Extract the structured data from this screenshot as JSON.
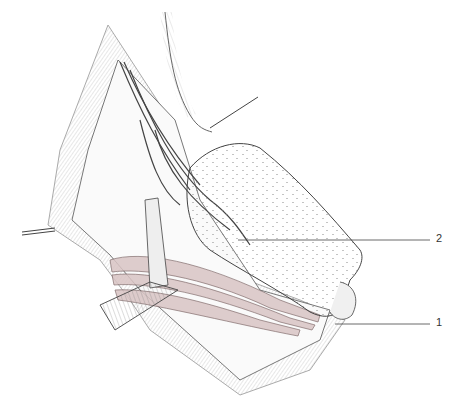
{
  "figure": {
    "type": "anatomical-illustration",
    "style": "pen-and-ink line drawing, grayscale with faint pink muscle tint",
    "labels": [
      {
        "id": "2",
        "text": "2",
        "leader_from": [
          238,
          240
        ],
        "leader_to": [
          430,
          240
        ]
      },
      {
        "id": "1",
        "text": "1",
        "leader_from": [
          335,
          324
        ],
        "leader_to": [
          430,
          324
        ]
      }
    ],
    "colors": {
      "ink": "#333333",
      "background": "#ffffff",
      "muscle_tint": "#b89a9a",
      "pad_fill": "#f4f4f2"
    }
  }
}
